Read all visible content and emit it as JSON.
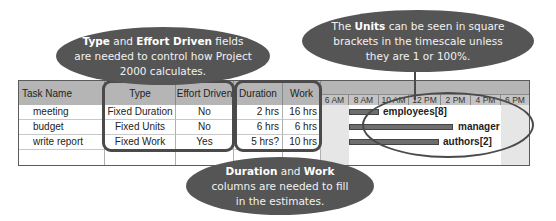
{
  "callouts": {
    "type_effort": {
      "bold1": "Type",
      "t1": " and ",
      "bold2": "Effort Driven",
      "t2": " fields are needed to control how Project 2000 calculates."
    },
    "units": {
      "t0": "The ",
      "bold1": "Units",
      "t1": " can be seen in square brackets in the timescale unless they are 1 or 100%."
    },
    "duration_work": {
      "bold1": "Duration",
      "t1": " and ",
      "bold2": "Work",
      "t2": " columns are needed to fill in the estimates."
    }
  },
  "table": {
    "columns": [
      "Task Name",
      "Type",
      "Effort Driven",
      "Duration",
      "Work"
    ],
    "rows": [
      {
        "task": "meeting",
        "type": "Fixed Duration",
        "effort": "No",
        "duration": "2 hrs",
        "work": "16 hrs"
      },
      {
        "task": "budget",
        "type": "Fixed Units",
        "effort": "No",
        "duration": "6 hrs",
        "work": "6 hrs"
      },
      {
        "task": "write report",
        "type": "Fixed Work",
        "effort": "Yes",
        "duration": "5 hrs?",
        "work": "10 hrs"
      }
    ]
  },
  "gantt": {
    "timescale": [
      "6 AM",
      "8 AM",
      "10 AM",
      "12 PM",
      "2 PM",
      "4 PM",
      "6 PM"
    ],
    "bars": [
      {
        "resource": "employees[8]"
      },
      {
        "resource": "manager"
      },
      {
        "resource": "authors[2]"
      }
    ]
  },
  "colors": {
    "callout_bg": "#555555",
    "header_bg": "#b5b5b5",
    "bar": "#6e6e6e"
  }
}
